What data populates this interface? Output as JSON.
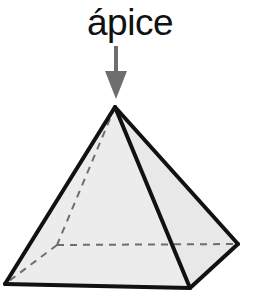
{
  "figure": {
    "title": "ápice",
    "label_text": "ápice",
    "shape_name": "square-pyramid",
    "background_color": "#ffffff",
    "face_fill_color": "#ececec",
    "face_fill_color_right": "#e8e8e8",
    "edge_color": "#111111",
    "hidden_edge_color": "#6e6e6e",
    "arrow_color": "#6e6e6e",
    "label_color": "#111111",
    "edge_width": 4,
    "hidden_edge_width": 2,
    "hidden_edge_dash": "7,6",
    "annotation": {
      "name": "apex-arrow",
      "direction": "down",
      "points_to": "apex",
      "shaft_x": 116,
      "shaft_top_y": 46,
      "shaft_bottom_y": 74,
      "shaft_width": 4,
      "head_top_y": 71,
      "head_tip_y": 99,
      "head_half_width": 11
    },
    "vertices": {
      "apex": {
        "name": "ápice",
        "x": 115,
        "y": 107
      },
      "base_left": {
        "name": "base-left",
        "x": 5,
        "y": 284
      },
      "base_front": {
        "name": "base-front",
        "x": 190,
        "y": 288
      },
      "base_right": {
        "name": "base-right",
        "x": 238,
        "y": 244
      },
      "base_back_hidden": {
        "name": "base-back-hidden",
        "x": 57,
        "y": 245
      }
    },
    "faces": [
      {
        "name": "left-face",
        "points": "115,107 5,284 190,288",
        "hidden": false
      },
      {
        "name": "right-face",
        "points": "115,107 190,288 238,244",
        "hidden": false
      }
    ],
    "visible_edges": [
      {
        "name": "apex-to-base-left",
        "x1": 115,
        "y1": 107,
        "x2": 5,
        "y2": 284
      },
      {
        "name": "apex-to-base-front",
        "x1": 115,
        "y1": 107,
        "x2": 190,
        "y2": 288
      },
      {
        "name": "apex-to-base-right",
        "x1": 115,
        "y1": 107,
        "x2": 238,
        "y2": 244
      },
      {
        "name": "base-left-to-base-front",
        "x1": 5,
        "y1": 284,
        "x2": 190,
        "y2": 288
      },
      {
        "name": "base-front-to-base-right",
        "x1": 190,
        "y1": 288,
        "x2": 238,
        "y2": 244
      }
    ],
    "hidden_edges": [
      {
        "name": "apex-to-base-back",
        "x1": 115,
        "y1": 107,
        "x2": 57,
        "y2": 245
      },
      {
        "name": "base-back-to-base-left",
        "x1": 57,
        "y1": 245,
        "x2": 5,
        "y2": 284
      },
      {
        "name": "base-back-to-base-right",
        "x1": 57,
        "y1": 245,
        "x2": 238,
        "y2": 244
      }
    ]
  }
}
